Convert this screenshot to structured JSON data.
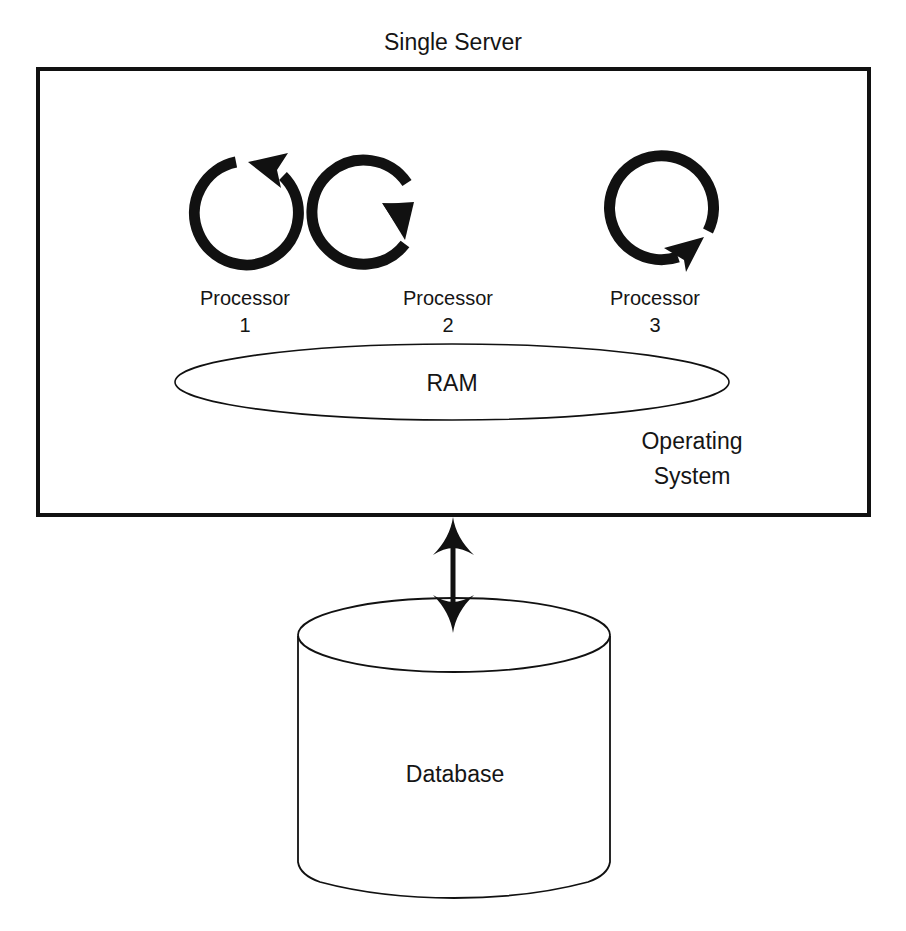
{
  "diagram": {
    "title": "Single Server",
    "server_box": {
      "label": "Single Server",
      "stroke_color": "#111111"
    },
    "processors": [
      {
        "name": "Processor",
        "number": "1",
        "icon": "cycle-arrow-icon"
      },
      {
        "name": "Processor",
        "number": "2",
        "icon": "cycle-arrow-icon"
      },
      {
        "name": "Processor",
        "number": "3",
        "icon": "cycle-arrow-icon"
      }
    ],
    "ram": {
      "label": "RAM"
    },
    "operating_system": {
      "line1": "Operating",
      "line2": "System"
    },
    "connector": {
      "type": "bidirectional-arrow",
      "icon": "double-arrow-icon"
    },
    "database": {
      "label": "Database",
      "icon": "cylinder-database-icon"
    },
    "colors": {
      "stroke": "#111111",
      "background": "#ffffff",
      "text": "#151515"
    }
  }
}
